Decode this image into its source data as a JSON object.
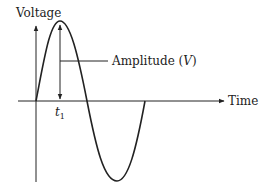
{
  "diagram": {
    "type": "sine-wave",
    "y_axis_label": "Voltage",
    "x_axis_label": "Time",
    "amplitude_label": "Amplitude (",
    "amplitude_symbol": "V",
    "amplitude_close": ")",
    "time_marker_label": "t",
    "time_marker_subscript": "1",
    "colors": {
      "stroke": "#222222",
      "background": "#ffffff"
    }
  }
}
